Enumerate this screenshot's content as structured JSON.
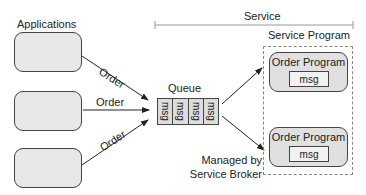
{
  "applications": {
    "label": "Applications",
    "boxes": [
      {
        "id": "app-1"
      },
      {
        "id": "app-2"
      },
      {
        "id": "app-3"
      }
    ]
  },
  "arrows": {
    "order_labels": [
      "Order",
      "Order",
      "Order"
    ]
  },
  "service": {
    "label": "Service",
    "program_label": "Service Program"
  },
  "queue": {
    "label": "Queue",
    "messages": [
      "msg",
      "msg",
      "msg",
      "msg"
    ]
  },
  "order_programs": [
    {
      "title": "Order Program",
      "msg": "msg"
    },
    {
      "title": "Order Program",
      "msg": "msg"
    }
  ],
  "broker_note": {
    "line1": "Managed by",
    "line2": "Service Broker"
  }
}
